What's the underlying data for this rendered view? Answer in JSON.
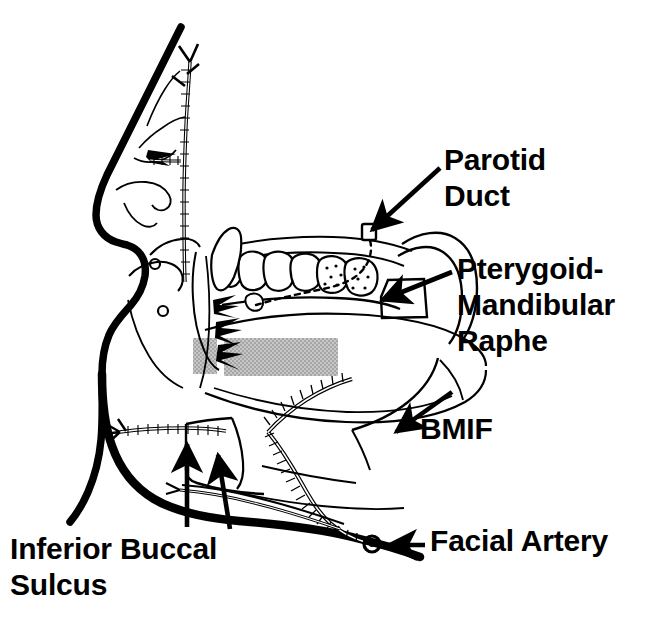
{
  "figure": {
    "kind": "anatomical-line-drawing",
    "background_color": "#ffffff",
    "ink_color": "#000000",
    "shading_color": "#b4b4b4",
    "labels": [
      {
        "id": "parotid-duct",
        "lines": [
          "Parotid",
          "Duct"
        ],
        "text": "Parotid Duct",
        "pointer": "arrow pointing down-left to the parotid duct orifice near the upper molars"
      },
      {
        "id": "pterygoid-mandibular-raphe",
        "lines": [
          "Pterygoid-",
          "Mandibular",
          "Raphe"
        ],
        "text": "Pterygoid-Mandibular Raphe",
        "pointer": "arrow pointing left to the raphe behind the maxillary tuberosity"
      },
      {
        "id": "bmif",
        "lines": [
          "BMIF"
        ],
        "text": "BMIF",
        "pointer": "arrow pointing up-left to the buccal mucosa inferior fornix region"
      },
      {
        "id": "facial-artery",
        "lines": [
          "Facial Artery"
        ],
        "text": "Facial Artery",
        "pointer": "arrow pointing left to the facial artery cross-section at the mandibular border"
      },
      {
        "id": "inferior-buccal-sulcus",
        "lines": [
          "Inferior Buccal",
          "Sulcus"
        ],
        "text": "Inferior Buccal Sulcus",
        "pointer": "two arrows pointing up into the inferior buccal sulcus"
      }
    ]
  }
}
